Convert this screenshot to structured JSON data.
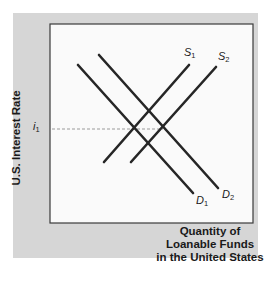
{
  "chart_data": {
    "type": "line",
    "title": "",
    "xlabel": "Quantity of Loanable Funds in the United States",
    "xlabel_lines": [
      "Quantity of",
      "Loanable Funds",
      "in the United States"
    ],
    "ylabel": "U.S. Interest Rate",
    "grid": false,
    "legend": "none (curves labeled directly)",
    "axis_ticks": {
      "y": [
        {
          "label": "i1",
          "display": "i",
          "subscript": "1"
        }
      ]
    },
    "series": [
      {
        "name": "D1",
        "label": "D",
        "subscript": "1",
        "kind": "demand",
        "slope": "negative",
        "points_px": [
          [
            78,
            65
          ],
          [
            193,
            193
          ]
        ]
      },
      {
        "name": "D2",
        "label": "D",
        "subscript": "2",
        "kind": "demand",
        "slope": "negative",
        "points_px": [
          [
            99,
            55
          ],
          [
            218,
            188
          ]
        ]
      },
      {
        "name": "S1",
        "label": "S",
        "subscript": "1",
        "kind": "supply",
        "slope": "positive",
        "points_px": [
          [
            104,
            162
          ],
          [
            189,
            65
          ]
        ]
      },
      {
        "name": "S2",
        "label": "S",
        "subscript": "2",
        "kind": "supply",
        "slope": "positive",
        "points_px": [
          [
            131,
            162
          ],
          [
            216,
            67
          ]
        ]
      }
    ],
    "annotations": [
      {
        "type": "dashed-horizontal",
        "at": "i1",
        "from_px": [
          52,
          129
        ],
        "to_px": [
          163,
          129
        ],
        "description": "Equilibrium interest rate i1 where D2 intersects S2 (and D1 intersects S1)"
      }
    ]
  },
  "labels": {
    "ylabel": "U.S. Interest Rate",
    "xlabel_lines": [
      "Quantity of",
      "Loanable Funds",
      "in the United States"
    ],
    "i1": {
      "main": "i",
      "sub": "1"
    },
    "S1": {
      "main": "S",
      "sub": "1"
    },
    "S2": {
      "main": "S",
      "sub": "2"
    },
    "D1": {
      "main": "D",
      "sub": "1"
    },
    "D2": {
      "main": "D",
      "sub": "2"
    }
  },
  "colors": {
    "panel": "#d6d6d6",
    "plot_bg": "#fafafa",
    "line": "#262626",
    "dash": "#9a9a9a"
  }
}
